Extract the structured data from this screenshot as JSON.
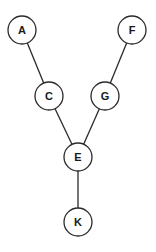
{
  "diagram": {
    "type": "tree-graph",
    "node_radius": 14,
    "colors": {
      "stroke": "#2a2a2a",
      "fill": "#ffffff",
      "text": "#1a1a1a",
      "background": "#ffffff"
    },
    "nodes": [
      {
        "id": "A",
        "label": "A",
        "x": 22,
        "y": 30
      },
      {
        "id": "F",
        "label": "F",
        "x": 132,
        "y": 30
      },
      {
        "id": "C",
        "label": "C",
        "x": 49,
        "y": 96
      },
      {
        "id": "G",
        "label": "G",
        "x": 105,
        "y": 96
      },
      {
        "id": "E",
        "label": "E",
        "x": 78,
        "y": 157
      },
      {
        "id": "K",
        "label": "K",
        "x": 78,
        "y": 222
      }
    ],
    "edges": [
      {
        "from": "A",
        "to": "C"
      },
      {
        "from": "F",
        "to": "G"
      },
      {
        "from": "C",
        "to": "E"
      },
      {
        "from": "G",
        "to": "E"
      },
      {
        "from": "E",
        "to": "K"
      }
    ]
  }
}
